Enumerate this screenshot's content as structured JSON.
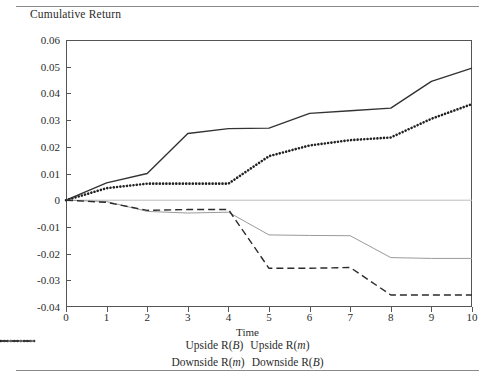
{
  "chart_data": {
    "type": "line",
    "title": "Cumulative Return",
    "xlabel": "Time",
    "ylabel": "",
    "xlim": [
      0,
      10
    ],
    "ylim": [
      -0.04,
      0.06
    ],
    "grid": false,
    "zero_line": true,
    "legend_position": "bottom",
    "x": [
      0,
      1,
      2,
      3,
      4,
      5,
      6,
      7,
      8,
      9,
      10
    ],
    "xticklabels": [
      "0",
      "1",
      "2",
      "3",
      "4",
      "5",
      "6",
      "7",
      "8",
      "9",
      "10"
    ],
    "yticklabels": [
      "0.06",
      "0.05",
      "0.04",
      "0.03",
      "0.02",
      "0.01",
      "0",
      "-0.01",
      "-0.02",
      "-0.03",
      "-0.04"
    ],
    "yticks": [
      0.06,
      0.05,
      0.04,
      0.03,
      0.02,
      0.01,
      0,
      -0.01,
      -0.02,
      -0.03,
      -0.04
    ],
    "series": [
      {
        "name": "Upside R(B)",
        "style": "solid",
        "color": "#333333",
        "width": 1.4,
        "values": [
          0,
          0.0065,
          0.01,
          0.025,
          0.0268,
          0.027,
          0.0325,
          0.0335,
          0.0345,
          0.0445,
          0.0495
        ]
      },
      {
        "name": "Upside R(m)",
        "style": "dotted",
        "color": "#222222",
        "width": 2.6,
        "values": [
          0,
          0.0045,
          0.0062,
          0.0062,
          0.0062,
          0.0165,
          0.0205,
          0.0225,
          0.0235,
          0.0305,
          0.036
        ]
      },
      {
        "name": "Downside R(m)",
        "style": "solid-light",
        "color": "#9a9a9a",
        "width": 1.0,
        "values": [
          0,
          -0.0005,
          -0.0042,
          -0.0048,
          -0.0045,
          -0.013,
          -0.0132,
          -0.0133,
          -0.0215,
          -0.0218,
          -0.0218
        ]
      },
      {
        "name": "Downside R(B)",
        "style": "dashed",
        "color": "#2b2b2b",
        "width": 1.4,
        "values": [
          0,
          -0.0008,
          -0.0038,
          -0.0035,
          -0.0035,
          -0.0255,
          -0.0255,
          -0.0252,
          -0.0355,
          -0.0355,
          -0.0355
        ]
      }
    ]
  },
  "legend": {
    "row1": [
      {
        "label_pre": "Upside R(",
        "label_var": "B",
        "label_post": ")",
        "style": "solid"
      },
      {
        "label_pre": "Upside R(",
        "label_var": "m",
        "label_post": ")",
        "style": "dotted"
      }
    ],
    "row2": [
      {
        "label_pre": "Downside R(",
        "label_var": "m",
        "label_post": ")",
        "style": "solid-light"
      },
      {
        "label_pre": "Downside R(",
        "label_var": "B",
        "label_post": ")",
        "style": "dashed"
      }
    ]
  }
}
